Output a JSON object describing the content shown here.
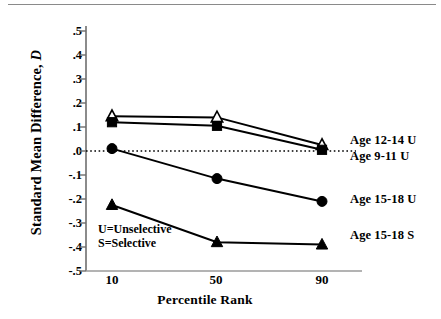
{
  "chart_data": {
    "type": "line",
    "title": "",
    "xlabel": "Percentile Rank",
    "ylabel": "Standard Mean Difference, D",
    "ylabel_plain": "Standard Mean Difference,",
    "ylabel_italic": "D",
    "categories": [
      "10",
      "50",
      "90"
    ],
    "x": [
      10,
      50,
      90
    ],
    "xlim": [
      0,
      100
    ],
    "ylim": [
      -0.5,
      0.5
    ],
    "ytick_labels": [
      ".5",
      ".4",
      ".3",
      ".2",
      ".1",
      ".0",
      "-.1",
      "-.2",
      "-.3",
      "-.4",
      "-.5"
    ],
    "ytick_values": [
      0.5,
      0.4,
      0.3,
      0.2,
      0.1,
      0.0,
      -0.1,
      -0.2,
      -0.3,
      -0.4,
      -0.5
    ],
    "grid": false,
    "zero_reference_line": 0.0,
    "legend_position": "right-of-plot",
    "series": [
      {
        "name": "Age 12-14 U",
        "marker": "open-triangle",
        "values": [
          0.145,
          0.14,
          0.025
        ]
      },
      {
        "name": "Age 9-11 U",
        "marker": "filled-square",
        "values": [
          0.12,
          0.105,
          0.005
        ]
      },
      {
        "name": "Age 15-18 U",
        "marker": "filled-circle",
        "values": [
          0.01,
          -0.115,
          -0.21
        ]
      },
      {
        "name": "Age 15-18 S",
        "marker": "filled-triangle",
        "values": [
          -0.225,
          -0.38,
          -0.39
        ]
      }
    ],
    "annotations": [
      "U=Unselective",
      "S=Selective"
    ],
    "colors": {
      "line": "#000000",
      "marker_fill": "#000000",
      "marker_open_fill": "#ffffff",
      "axis": "#6e6e6e",
      "background": "#ffffff",
      "zero_line": "#000000"
    }
  },
  "series_labels": {
    "age_12_14_u": "Age 12-14 U",
    "age_9_11_u": "Age 9-11 U",
    "age_15_18_u": "Age 15-18 U",
    "age_15_18_s": "Age 15-18 S"
  },
  "notes": {
    "line1": "U=Unselective",
    "line2": "S=Selective"
  },
  "axes": {
    "x_title": "Percentile Rank",
    "y_title_plain": "Standard Mean Difference,",
    "y_title_italic": "D",
    "xticks": [
      "10",
      "50",
      "90"
    ],
    "yticks": [
      ".5",
      ".4",
      ".3",
      ".2",
      ".1",
      ".0",
      "-.1",
      "-.2",
      "-.3",
      "-.4",
      "-.5"
    ]
  }
}
